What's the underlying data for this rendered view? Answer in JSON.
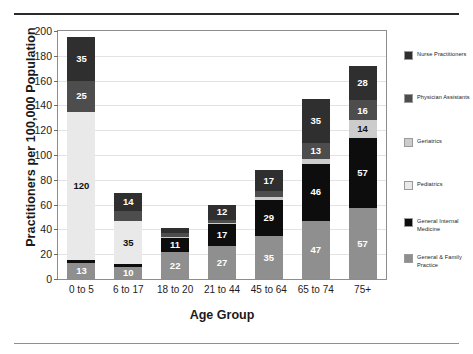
{
  "chart_data": {
    "type": "bar",
    "stacked": true,
    "title": "",
    "xlabel": "Age Group",
    "ylabel": "Practitioners per 100,000 Population",
    "categories": [
      "0 to 5",
      "6 to 17",
      "18 to 20",
      "21 to 44",
      "45 to 64",
      "65 to 74",
      "75+"
    ],
    "ylim": [
      0,
      200
    ],
    "yticks": [
      0,
      20,
      40,
      60,
      80,
      100,
      120,
      140,
      160,
      180,
      200
    ],
    "grid": true,
    "legend_position": "right",
    "series": [
      {
        "name": "General & Family Practice",
        "color": "#8f8f8f",
        "values": [
          13,
          10,
          22,
          27,
          35,
          47,
          57
        ],
        "labels": [
          "13",
          "10",
          "22",
          "27",
          "35",
          "47",
          "57"
        ]
      },
      {
        "name": "General Internal Medicine",
        "color": "#0d0d0d",
        "values": [
          2,
          2,
          11,
          17,
          29,
          46,
          57
        ],
        "labels": [
          "",
          "",
          "11",
          "17",
          "29",
          "46",
          "57"
        ]
      },
      {
        "name": "Pediatrics",
        "color": "#e9e9e9",
        "values": [
          120,
          35,
          0,
          0,
          0,
          0,
          0
        ],
        "labels": [
          "120",
          "35",
          "",
          "",
          "",
          "",
          ""
        ]
      },
      {
        "name": "Geriatrics",
        "color": "#cccccc",
        "values": [
          0,
          0,
          1,
          1,
          2,
          4,
          14
        ],
        "labels": [
          "",
          "",
          "",
          "",
          "",
          "",
          "14"
        ]
      },
      {
        "name": "Physician Assistants",
        "color": "#4d4d4d",
        "values": [
          25,
          8,
          3,
          3,
          5,
          13,
          16
        ],
        "labels": [
          "25",
          "",
          "",
          "",
          "",
          "13",
          "16"
        ]
      },
      {
        "name": "Nurse Practitioners",
        "color": "#2f2f2f",
        "values": [
          35,
          14,
          4,
          12,
          17,
          35,
          28
        ],
        "labels": [
          "35",
          "14",
          "",
          "12",
          "17",
          "35",
          "28"
        ]
      }
    ],
    "totals": [
      195,
      69,
      41,
      60,
      88,
      145,
      172
    ],
    "legend_entries": [
      {
        "label": "Nurse Practitioners",
        "color": "#2f2f2f"
      },
      {
        "label": "Physician Assistants",
        "color": "#4d4d4d"
      },
      {
        "label": "Geriatrics",
        "color": "#cccccc"
      },
      {
        "label": "Pediatrics",
        "color": "#e9e9e9"
      },
      {
        "label": "General Internal Medicine",
        "color": "#0d0d0d"
      },
      {
        "label": "General & Family Practice",
        "color": "#8f8f8f"
      }
    ]
  }
}
